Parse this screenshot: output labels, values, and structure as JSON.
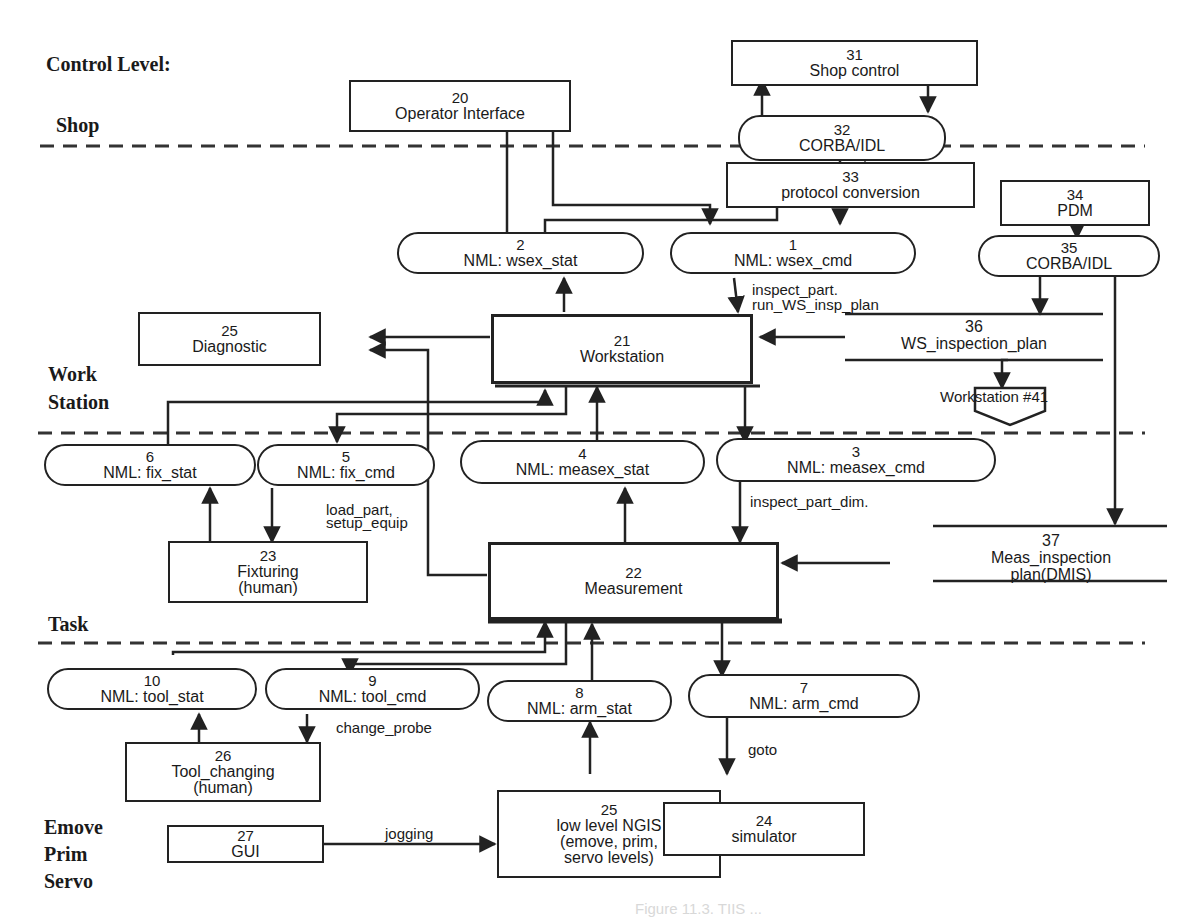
{
  "diagram": {
    "title": "Control Level:",
    "levels": [
      {
        "id": "shop",
        "label": "Shop"
      },
      {
        "id": "workstation",
        "label_line1": "Work",
        "label_line2": "Station"
      },
      {
        "id": "task",
        "label": "Task"
      },
      {
        "id": "emove",
        "label_line1": "Emove",
        "label_line2": "Prim",
        "label_line3": "Servo"
      }
    ],
    "nodes": {
      "n31": {
        "num": "31",
        "label": "Shop control",
        "shape": "rect"
      },
      "n32": {
        "num": "32",
        "label": "CORBA/IDL",
        "shape": "pill"
      },
      "n20": {
        "num": "20",
        "label": "Operator Interface",
        "shape": "rect"
      },
      "n33": {
        "num": "33",
        "label": "protocol conversion",
        "shape": "rect"
      },
      "n34": {
        "num": "34",
        "label": "PDM",
        "shape": "rect"
      },
      "n35": {
        "num": "35",
        "label": "CORBA/IDL",
        "shape": "pill"
      },
      "n2": {
        "num": "2",
        "label": "NML: wsex_stat",
        "shape": "pill"
      },
      "n1": {
        "num": "1",
        "label": "NML: wsex_cmd",
        "shape": "pill"
      },
      "n25a": {
        "num": "25",
        "label": "Diagnostic",
        "shape": "rect"
      },
      "n21": {
        "num": "21",
        "label": "Workstation",
        "shape": "rect"
      },
      "n36": {
        "num": "36",
        "label": "WS_inspection_plan",
        "shape": "datastore"
      },
      "n41": {
        "label": "Workstation #41",
        "shape": "offpage"
      },
      "n6": {
        "num": "6",
        "label": "NML: fix_stat",
        "shape": "pill"
      },
      "n5": {
        "num": "5",
        "label": "NML: fix_cmd",
        "shape": "pill"
      },
      "n4": {
        "num": "4",
        "label": "NML: measex_stat",
        "shape": "pill"
      },
      "n3": {
        "num": "3",
        "label": "NML: measex_cmd",
        "shape": "pill"
      },
      "n23": {
        "num": "23",
        "label": "Fixturing",
        "label2": "(human)",
        "shape": "rect"
      },
      "n22": {
        "num": "22",
        "label": "Measurement",
        "shape": "rect"
      },
      "n37": {
        "num": "37",
        "label": "Meas_inspection",
        "label2": "plan(DMIS)",
        "shape": "datastore"
      },
      "n10": {
        "num": "10",
        "label": "NML: tool_stat",
        "shape": "pill"
      },
      "n9": {
        "num": "9",
        "label": "NML: tool_cmd",
        "shape": "pill"
      },
      "n8": {
        "num": "8",
        "label": "NML: arm_stat",
        "shape": "pill"
      },
      "n7": {
        "num": "7",
        "label": "NML: arm_cmd",
        "shape": "pill"
      },
      "n26": {
        "num": "26",
        "label": "Tool_changing",
        "label2": "(human)",
        "shape": "rect"
      },
      "n27": {
        "num": "27",
        "label": "GUI",
        "shape": "rect"
      },
      "n25b": {
        "num": "25",
        "label": "low level NGIS",
        "label2": "(emove, prim,",
        "label3": "servo levels)",
        "shape": "rect"
      },
      "n24": {
        "num": "24",
        "label": "simulator",
        "shape": "rect"
      }
    },
    "edge_labels": {
      "inspect_part": "inspect_part.",
      "run_ws": "run_WS_insp_plan",
      "load_part": "load_part,",
      "setup_equip": "setup_equip",
      "inspect_dim": "inspect_part_dim.",
      "change_probe": "change_probe",
      "goto": "goto",
      "jogging": "jogging"
    },
    "caption": "Figure 11.3. TIIS ..."
  }
}
